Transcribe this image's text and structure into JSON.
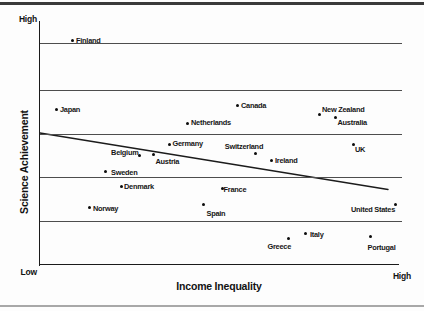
{
  "chart_data": {
    "type": "scatter",
    "title": "",
    "xlabel": "Income Inequality",
    "ylabel": "Science Achievement",
    "x_axis": {
      "right_label": "High"
    },
    "y_axis": {
      "top_label": "High",
      "bottom_label": "Low"
    },
    "grid": true,
    "legend": false,
    "plot_px": {
      "left": 39.5,
      "top": 20.5,
      "right": 398,
      "bottom": 264.5,
      "grid_right": 402
    },
    "gridlines_y_px": [
      43.3,
      89.5,
      133.5,
      177.3,
      221
    ],
    "trend_line_px": {
      "x1": 40,
      "y1": 133,
      "x2": 388,
      "y2": 189.5
    },
    "colors": {
      "dot": "#0c0c0c",
      "trend_line": "#1b1b1b",
      "gridline": "#4d4d4d",
      "axis": "#1b1b1b",
      "label_text": "#161616"
    },
    "points": [
      {
        "name": "Finland",
        "x_px": 72.5,
        "y_px": 40.5,
        "label_side": "right"
      },
      {
        "name": "Japan",
        "x_px": 56.5,
        "y_px": 109.5,
        "label_side": "right"
      },
      {
        "name": "Canada",
        "x_px": 237.5,
        "y_px": 105.5,
        "label_side": "right"
      },
      {
        "name": "New Zealand",
        "x_px": 319.5,
        "y_px": 114,
        "label_side": "above-right",
        "dy": 3
      },
      {
        "name": "Netherlands",
        "x_px": 187.5,
        "y_px": 123,
        "label_side": "right"
      },
      {
        "name": "Australia",
        "x_px": 335.5,
        "y_px": 117.5,
        "label_side": "below-right",
        "dy": -2
      },
      {
        "name": "Germany",
        "x_px": 169,
        "y_px": 144,
        "label_side": "right"
      },
      {
        "name": "Switzerland",
        "x_px": 255,
        "y_px": 153.5,
        "label_side": "above",
        "dx": -11
      },
      {
        "name": "Belgium",
        "x_px": 139,
        "y_px": 155.5,
        "label_side": "left",
        "dx": 3,
        "dy": -3
      },
      {
        "name": "Austria",
        "x_px": 153.5,
        "y_px": 154.5,
        "label_side": "below-right"
      },
      {
        "name": "Ireland",
        "x_px": 271.5,
        "y_px": 160.5,
        "label_side": "right"
      },
      {
        "name": "UK",
        "x_px": 353,
        "y_px": 144,
        "label_side": "below-right",
        "dy": -1
      },
      {
        "name": "Sweden",
        "x_px": 105.5,
        "y_px": 171.5,
        "label_side": "right",
        "dx": 2,
        "dy": 1
      },
      {
        "name": "Denmark",
        "x_px": 121.5,
        "y_px": 186,
        "label_side": "right",
        "dx": -1,
        "dy": 1
      },
      {
        "name": "France",
        "x_px": 222,
        "y_px": 188,
        "label_side": "right",
        "dx": -2,
        "dy": 1.5
      },
      {
        "name": "Norway",
        "x_px": 89.5,
        "y_px": 207.5,
        "label_side": "right",
        "dy": 1
      },
      {
        "name": "Spain",
        "x_px": 203.5,
        "y_px": 204.7,
        "label_side": "below-right",
        "dx": 1,
        "dy": 2
      },
      {
        "name": "United States",
        "x_px": 395.5,
        "y_px": 204.5,
        "label_side": "left",
        "dx": 3,
        "dy": 5
      },
      {
        "name": "Italy",
        "x_px": 305,
        "y_px": 233.5,
        "label_side": "right",
        "dx": 1.5,
        "dy": 1.5
      },
      {
        "name": "Greece",
        "x_px": 288.5,
        "y_px": 238.5,
        "label_side": "below-left",
        "dy": 1
      },
      {
        "name": "Portugal",
        "x_px": 370,
        "y_px": 236.5,
        "label_side": "below-right",
        "dx": -4.5,
        "dy": 4
      }
    ]
  }
}
